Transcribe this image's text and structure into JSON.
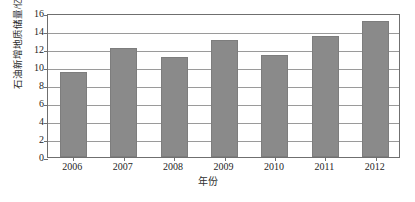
{
  "chart_data": {
    "type": "bar",
    "title": "",
    "subtitle": "",
    "xlabel": "年份",
    "ylabel": "石油新增地质储量/亿吨",
    "categories": [
      "2006",
      "2007",
      "2008",
      "2009",
      "2010",
      "2011",
      "2012"
    ],
    "values": [
      9.4,
      12.1,
      11.1,
      13.0,
      11.3,
      13.4,
      15.1
    ],
    "series": [
      {
        "name": "石油新增地质储量",
        "values": [
          9.4,
          12.1,
          11.1,
          13.0,
          11.3,
          13.4,
          15.1
        ]
      }
    ],
    "ylim": [
      0,
      16
    ],
    "ytick_values": [
      0,
      2,
      4,
      6,
      8,
      10,
      12,
      14,
      16
    ],
    "ytick_labels": [
      "0",
      "2",
      "4",
      "6",
      "8",
      "10",
      "12",
      "14",
      "16"
    ],
    "xtick_labels": [
      "2006",
      "2007",
      "2008",
      "2009",
      "2010",
      "2011",
      "2012"
    ],
    "grid": true,
    "grid_axis": "y",
    "legend": false,
    "legend_position": "none",
    "bar_color": "#8a8a8a",
    "grid_color": "#9a9a9a",
    "axis_color": "#6f6f6f",
    "text_color": "#262626",
    "background_color": "#ffffff",
    "annotations": []
  }
}
